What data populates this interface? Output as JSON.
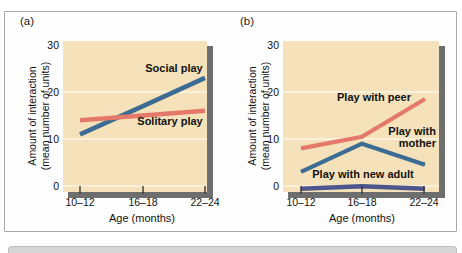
{
  "figure": {
    "frame_border_color": "#a8a8a8",
    "panels": [
      {
        "label": "(a)"
      },
      {
        "label": "(b)"
      }
    ]
  },
  "axes": {
    "y_title_line1": "Amount of interaction",
    "y_title_line2": "(mean number of units)",
    "x_title": "Age (months)",
    "y_ticks": [
      "30",
      "20",
      "10",
      "0"
    ],
    "x_ticks": [
      "10–12",
      "16–18",
      "22–24"
    ]
  },
  "colors": {
    "plot_background": "#f6e2ba",
    "gridline": "#fdf5e3",
    "shadow_gray": "#6e6e6e",
    "line_blue": "#3c6b93",
    "line_salmon": "#e4786b",
    "line_navy": "#4d568c"
  },
  "chart_data": [
    {
      "type": "line",
      "panel": "(a)",
      "categories": [
        "10–12",
        "16–18",
        "22–24"
      ],
      "xlabel": "Age (months)",
      "ylabel": "Amount of interaction (mean number of units)",
      "ylim": [
        0,
        30
      ],
      "grid": true,
      "series": [
        {
          "name": "Social play",
          "values": [
            11,
            17,
            23
          ],
          "color": "#3c6b93"
        },
        {
          "name": "Solitary play",
          "values": [
            14,
            15,
            16
          ],
          "color": "#e4786b"
        }
      ]
    },
    {
      "type": "line",
      "panel": "(b)",
      "categories": [
        "10–12",
        "16–18",
        "22–24"
      ],
      "xlabel": "Age (months)",
      "ylabel": "Amount of interaction (mean number of units)",
      "ylim": [
        0,
        30
      ],
      "grid": true,
      "series": [
        {
          "name": "Play with peer",
          "values": [
            8,
            10.5,
            18.5
          ],
          "color": "#e4786b"
        },
        {
          "name": "Play with mother",
          "values": [
            3,
            9,
            4.5
          ],
          "color": "#3c6b93"
        },
        {
          "name": "Play with new adult",
          "values": [
            0.5,
            1,
            0.5
          ],
          "color": "#4d568c"
        }
      ]
    }
  ]
}
